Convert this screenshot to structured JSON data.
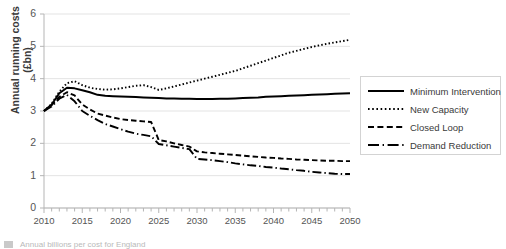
{
  "chart_data": {
    "type": "line",
    "title": "",
    "xlabel": "",
    "ylabel": "Annual running costs (£bn)",
    "xlim": [
      2010,
      2050
    ],
    "ylim": [
      0,
      6
    ],
    "ytick_labels": [
      "0",
      "1",
      "2",
      "3",
      "4",
      "5",
      "6"
    ],
    "ytick_values": [
      0,
      1,
      2,
      3,
      4,
      5,
      6
    ],
    "xtick_labels": [
      "2010",
      "2015",
      "2020",
      "2025",
      "2030",
      "2035",
      "2040",
      "2045",
      "2050"
    ],
    "xtick_values": [
      2010,
      2015,
      2020,
      2025,
      2030,
      2035,
      2040,
      2045,
      2050
    ],
    "minor_xticks_interval": 1,
    "grid": "horizontal",
    "legend_position": "right",
    "x": [
      2010,
      2011,
      2012,
      2013,
      2014,
      2015,
      2016,
      2017,
      2018,
      2019,
      2020,
      2021,
      2022,
      2023,
      2024,
      2025,
      2026,
      2027,
      2028,
      2029,
      2030,
      2031,
      2032,
      2033,
      2034,
      2035,
      2036,
      2037,
      2038,
      2039,
      2040,
      2041,
      2042,
      2043,
      2044,
      2045,
      2046,
      2047,
      2048,
      2049,
      2050
    ],
    "series": [
      {
        "name": "Minimum Intervention",
        "style": "solid",
        "color": "#000000",
        "values": [
          3.0,
          3.2,
          3.55,
          3.72,
          3.7,
          3.64,
          3.58,
          3.5,
          3.47,
          3.46,
          3.45,
          3.44,
          3.43,
          3.42,
          3.41,
          3.4,
          3.39,
          3.39,
          3.38,
          3.38,
          3.37,
          3.37,
          3.37,
          3.38,
          3.38,
          3.39,
          3.4,
          3.41,
          3.42,
          3.44,
          3.45,
          3.46,
          3.47,
          3.48,
          3.49,
          3.5,
          3.51,
          3.52,
          3.53,
          3.54,
          3.55
        ]
      },
      {
        "name": "New Capacity",
        "style": "dotted",
        "color": "#000000",
        "values": [
          3.0,
          3.22,
          3.6,
          3.86,
          3.92,
          3.8,
          3.72,
          3.68,
          3.66,
          3.67,
          3.7,
          3.74,
          3.78,
          3.8,
          3.74,
          3.65,
          3.7,
          3.76,
          3.82,
          3.88,
          3.94,
          4.0,
          4.06,
          4.12,
          4.18,
          4.24,
          4.32,
          4.4,
          4.48,
          4.56,
          4.64,
          4.72,
          4.8,
          4.86,
          4.92,
          4.98,
          5.03,
          5.08,
          5.12,
          5.16,
          5.2
        ]
      },
      {
        "name": "Closed Loop",
        "style": "dashed",
        "color": "#000000",
        "values": [
          3.0,
          3.18,
          3.44,
          3.58,
          3.48,
          3.2,
          3.05,
          2.92,
          2.86,
          2.8,
          2.75,
          2.72,
          2.7,
          2.68,
          2.66,
          2.1,
          2.06,
          2.0,
          1.95,
          1.9,
          1.75,
          1.72,
          1.7,
          1.68,
          1.66,
          1.64,
          1.62,
          1.6,
          1.58,
          1.56,
          1.55,
          1.53,
          1.52,
          1.5,
          1.49,
          1.48,
          1.47,
          1.46,
          1.46,
          1.45,
          1.45
        ]
      },
      {
        "name": "Demand Reduction",
        "style": "dashdot",
        "color": "#000000",
        "values": [
          3.0,
          3.14,
          3.38,
          3.5,
          3.3,
          3.0,
          2.85,
          2.72,
          2.6,
          2.52,
          2.44,
          2.36,
          2.3,
          2.26,
          2.22,
          1.98,
          1.94,
          1.9,
          1.86,
          1.82,
          1.52,
          1.5,
          1.48,
          1.45,
          1.42,
          1.38,
          1.35,
          1.32,
          1.3,
          1.27,
          1.25,
          1.22,
          1.2,
          1.17,
          1.15,
          1.12,
          1.1,
          1.08,
          1.06,
          1.05,
          1.05
        ]
      }
    ]
  },
  "legend": {
    "items": [
      {
        "label": "Minimum Intervention",
        "style": "solid"
      },
      {
        "label": "New Capacity",
        "style": "dotted"
      },
      {
        "label": "Closed Loop",
        "style": "dashed"
      },
      {
        "label": "Demand Reduction",
        "style": "dashdot"
      }
    ]
  },
  "caption": {
    "text": "Annual billions per cost for England"
  },
  "colors": {
    "series": "#000000",
    "gridline": "#e3e3e3",
    "axis": "#b5b5b5",
    "text": "#404040"
  }
}
